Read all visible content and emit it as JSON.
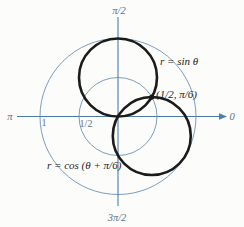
{
  "colors": {
    "axis": "#4d7ca8",
    "grid": "#7d9dbb",
    "curve": "#1b1b1b",
    "axis_text": "#5f7184",
    "background": "#fcfcfa"
  },
  "chart_data": {
    "type": "line",
    "coordinate_system": "polar",
    "title": "",
    "axis_range": [
      0,
      1
    ],
    "grid_circle_radii": [
      0.5,
      1
    ],
    "angle_labels": {
      "top": "π/2",
      "right": "0",
      "left": "π",
      "bottom": "3π/2"
    },
    "radius_ticks": [
      {
        "label": "1",
        "r": 1
      },
      {
        "label": "1/2",
        "r": 0.5
      }
    ],
    "curves": [
      {
        "label": "r = sin θ",
        "equation": "r = sin(θ)",
        "shape": "circle",
        "center_xy": [
          0,
          0.5
        ],
        "radius": 0.5
      },
      {
        "label": "r = cos (θ + π/6)",
        "equation": "r = cos(θ + π/6)",
        "shape": "circle",
        "center_xy": [
          0.433,
          -0.25
        ],
        "radius": 0.5
      }
    ],
    "marked_points": [
      {
        "label": "(1/2, π/6)",
        "r": 0.5,
        "theta": "π/6",
        "xy": [
          0.433,
          0.25
        ]
      }
    ]
  }
}
